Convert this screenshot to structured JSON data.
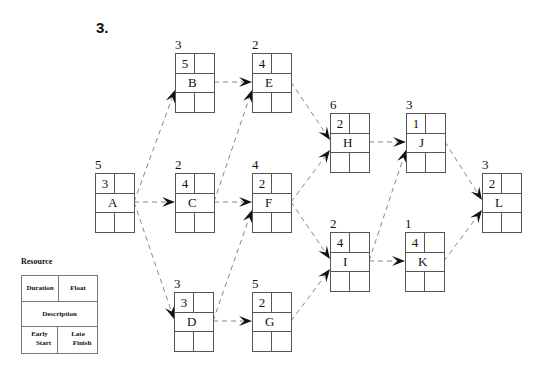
{
  "heading": "3.",
  "nodes": {
    "A": {
      "resource": "5",
      "duration": "3",
      "description": "A",
      "float": "",
      "early_start": "",
      "late_finish": "",
      "x": 95,
      "y": 173
    },
    "B": {
      "resource": "3",
      "duration": "5",
      "description": "B",
      "float": "",
      "early_start": "",
      "late_finish": "",
      "x": 175,
      "y": 53
    },
    "C": {
      "resource": "2",
      "duration": "4",
      "description": "C",
      "float": "",
      "early_start": "",
      "late_finish": "",
      "x": 175,
      "y": 173
    },
    "D": {
      "resource": "3",
      "duration": "3",
      "description": "D",
      "float": "",
      "early_start": "",
      "late_finish": "",
      "x": 174,
      "y": 292
    },
    "E": {
      "resource": "2",
      "duration": "4",
      "description": "E",
      "float": "",
      "early_start": "",
      "late_finish": "",
      "x": 252,
      "y": 53
    },
    "F": {
      "resource": "4",
      "duration": "2",
      "description": "F",
      "float": "",
      "early_start": "",
      "late_finish": "",
      "x": 252,
      "y": 173
    },
    "G": {
      "resource": "5",
      "duration": "2",
      "description": "G",
      "float": "",
      "early_start": "",
      "late_finish": "",
      "x": 252,
      "y": 292
    },
    "H": {
      "resource": "6",
      "duration": "2",
      "description": "H",
      "float": "",
      "early_start": "",
      "late_finish": "",
      "x": 330,
      "y": 113
    },
    "I": {
      "resource": "2",
      "duration": "4",
      "description": "I",
      "float": "",
      "early_start": "",
      "late_finish": "",
      "x": 330,
      "y": 232
    },
    "J": {
      "resource": "3",
      "duration": "1",
      "description": "J",
      "float": "",
      "early_start": "",
      "late_finish": "",
      "x": 406,
      "y": 113
    },
    "K": {
      "resource": "1",
      "duration": "4",
      "description": "K",
      "float": "",
      "early_start": "",
      "late_finish": "",
      "x": 405,
      "y": 232
    },
    "L": {
      "resource": "3",
      "duration": "2",
      "description": "L",
      "float": "",
      "early_start": "",
      "late_finish": "",
      "x": 482,
      "y": 173
    }
  },
  "edges": [
    [
      "A",
      "B"
    ],
    [
      "A",
      "C"
    ],
    [
      "A",
      "D"
    ],
    [
      "B",
      "E"
    ],
    [
      "C",
      "E"
    ],
    [
      "C",
      "F"
    ],
    [
      "D",
      "F"
    ],
    [
      "D",
      "G"
    ],
    [
      "E",
      "H"
    ],
    [
      "F",
      "H"
    ],
    [
      "F",
      "I"
    ],
    [
      "G",
      "I"
    ],
    [
      "H",
      "J"
    ],
    [
      "I",
      "J"
    ],
    [
      "I",
      "K"
    ],
    [
      "J",
      "L"
    ],
    [
      "K",
      "L"
    ]
  ],
  "legend": {
    "title": "Resource",
    "duration": "Duration",
    "float": "Float",
    "description": "Description",
    "early_start_1": "Early",
    "early_start_2": "Start",
    "late_finish_1": "Late",
    "late_finish_2": "Finish"
  },
  "colors": {
    "line": "#555555",
    "edge": "#888888",
    "arrow": "#111111"
  }
}
